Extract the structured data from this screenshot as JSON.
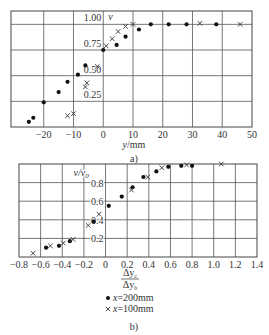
{
  "chart_data": [
    {
      "type": "scatter",
      "panel_label": "a)",
      "title": "",
      "xlabel": "y/mm",
      "ylabel": "v",
      "xlim": [
        -31,
        50
      ],
      "ylim": [
        0,
        1.13
      ],
      "x_ticks": [
        -20,
        -10,
        0,
        10,
        20,
        30,
        40,
        50
      ],
      "x_tick_labels": [
        "−20",
        "−10",
        "0",
        "10",
        "20",
        "30",
        "40",
        "50"
      ],
      "y_ticks": [
        0.25,
        0.5,
        0.75,
        1.0
      ],
      "y_tick_labels": [
        "0.25",
        "0.50",
        "0.75",
        "1.00"
      ],
      "grid": true,
      "series": [
        {
          "name": "x=200mm",
          "marker": "dot",
          "points": [
            [
              -25,
              0.05
            ],
            [
              -23.5,
              0.09
            ],
            [
              -20,
              0.24
            ],
            [
              -15,
              0.34
            ],
            [
              -12,
              0.44
            ],
            [
              -8.5,
              0.51
            ],
            [
              -6,
              0.6
            ],
            [
              0,
              0.75
            ],
            [
              4.5,
              0.8
            ],
            [
              7.5,
              0.88
            ],
            [
              12,
              0.95
            ],
            [
              16,
              1.0
            ],
            [
              22,
              1.0
            ],
            [
              28,
              1.0
            ],
            [
              38,
              1.0
            ]
          ]
        },
        {
          "name": "x=100mm",
          "marker": "cross",
          "points": [
            [
              -12,
              0.11
            ],
            [
              -10,
              0.13
            ],
            [
              -6,
              0.39
            ],
            [
              -5.5,
              0.43
            ],
            [
              -2,
              0.59
            ],
            [
              1,
              0.79
            ],
            [
              3,
              0.86
            ],
            [
              5,
              0.93
            ],
            [
              7.5,
              0.98
            ],
            [
              10,
              1.0
            ],
            [
              32.5,
              1.01
            ],
            [
              46,
              1.0
            ]
          ]
        }
      ]
    },
    {
      "type": "scatter",
      "panel_label": "b)",
      "title": "",
      "xlabel": "Δy_c / Δy_b",
      "xlabel_num": "Δy",
      "xlabel_num_sub": "c",
      "xlabel_den": "Δy",
      "xlabel_den_sub": "b",
      "ylabel": "v/v0",
      "xlim": [
        -0.8,
        1.4
      ],
      "ylim": [
        0,
        1.0
      ],
      "x_ticks": [
        -0.8,
        -0.6,
        -0.4,
        -0.2,
        0,
        0.2,
        0.4,
        0.6,
        0.8,
        1.0,
        1.2,
        1.4
      ],
      "x_tick_labels": [
        "−0.8",
        "−0.6",
        "−0.4",
        "−0.2",
        "0",
        "0.2",
        "0.4",
        "0.6",
        "0.8",
        "1.0",
        "1.2",
        "1.4"
      ],
      "y_ticks": [
        0.2,
        0.4,
        0.6,
        0.8
      ],
      "y_tick_labels": [
        "0.2",
        "0.4",
        "0.6",
        "0.8"
      ],
      "grid": true,
      "series": [
        {
          "name": "x=200mm",
          "marker": "dot",
          "points": [
            [
              -0.55,
              0.1
            ],
            [
              -0.43,
              0.12
            ],
            [
              -0.33,
              0.17
            ],
            [
              -0.11,
              0.38
            ],
            [
              0.03,
              0.55
            ],
            [
              0.15,
              0.65
            ],
            [
              0.25,
              0.75
            ],
            [
              0.35,
              0.86
            ],
            [
              0.47,
              0.92
            ],
            [
              0.58,
              0.97
            ],
            [
              0.7,
              0.98
            ],
            [
              0.8,
              0.98
            ]
          ]
        },
        {
          "name": "x=100mm",
          "marker": "cross",
          "points": [
            [
              -0.67,
              0.04
            ],
            [
              -0.51,
              0.12
            ],
            [
              -0.39,
              0.15
            ],
            [
              -0.3,
              0.19
            ],
            [
              -0.16,
              0.34
            ],
            [
              -0.06,
              0.46
            ],
            [
              0.24,
              0.72
            ],
            [
              0.39,
              0.86
            ],
            [
              0.52,
              0.96
            ],
            [
              0.75,
              0.99
            ],
            [
              1.07,
              1.0
            ]
          ]
        }
      ],
      "legend": [
        {
          "marker": "dot",
          "label": "x=200mm"
        },
        {
          "marker": "cross",
          "label": "x=100mm"
        }
      ]
    }
  ]
}
